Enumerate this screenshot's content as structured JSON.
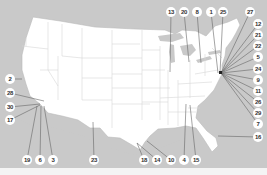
{
  "map": {
    "title": "United States map with numbered callouts",
    "colors": {
      "ocean": "#c9c9c9",
      "land": "#ffffff",
      "border": "#d6d6d6",
      "leader": "#666666",
      "marker": "#222222"
    },
    "labels": [
      {
        "id": "13",
        "x": 171,
        "y": 12,
        "tx": 170,
        "ty": 72
      },
      {
        "id": "20",
        "x": 184,
        "y": 12,
        "tx": 189,
        "ty": 62
      },
      {
        "id": "8",
        "x": 197,
        "y": 12,
        "tx": 201,
        "ty": 63
      },
      {
        "id": "1",
        "x": 211,
        "y": 12,
        "tx": 218,
        "ty": 73
      },
      {
        "id": "25",
        "x": 223,
        "y": 12,
        "tx": 220,
        "ty": 73
      },
      {
        "id": "27",
        "x": 250,
        "y": 12,
        "tx": 221,
        "ty": 73
      },
      {
        "id": "12",
        "x": 258,
        "y": 24,
        "tx": 221,
        "ty": 73
      },
      {
        "id": "21",
        "x": 258,
        "y": 35,
        "tx": 221,
        "ty": 73
      },
      {
        "id": "22",
        "x": 258,
        "y": 46,
        "tx": 221,
        "ty": 73
      },
      {
        "id": "5",
        "x": 258,
        "y": 57,
        "tx": 221,
        "ty": 73
      },
      {
        "id": "24",
        "x": 258,
        "y": 69,
        "tx": 221,
        "ty": 73
      },
      {
        "id": "9",
        "x": 258,
        "y": 80,
        "tx": 221,
        "ty": 73
      },
      {
        "id": "11",
        "x": 258,
        "y": 91,
        "tx": 221,
        "ty": 73
      },
      {
        "id": "26",
        "x": 258,
        "y": 102,
        "tx": 221,
        "ty": 73
      },
      {
        "id": "29",
        "x": 258,
        "y": 113,
        "tx": 221,
        "ty": 73
      },
      {
        "id": "7",
        "x": 258,
        "y": 124,
        "tx": 221,
        "ty": 73
      },
      {
        "id": "16",
        "x": 258,
        "y": 137,
        "tx": 218,
        "ty": 136
      },
      {
        "id": "2",
        "x": 10,
        "y": 79,
        "tx": 22,
        "ty": 79
      },
      {
        "id": "28",
        "x": 10,
        "y": 93,
        "tx": 44,
        "ty": 101
      },
      {
        "id": "30",
        "x": 10,
        "y": 107,
        "tx": 40,
        "ty": 104
      },
      {
        "id": "17",
        "x": 10,
        "y": 120,
        "tx": 40,
        "ty": 105
      },
      {
        "id": "19",
        "x": 27,
        "y": 160,
        "tx": 37,
        "ty": 106
      },
      {
        "id": "6",
        "x": 40,
        "y": 160,
        "tx": 41,
        "ty": 106
      },
      {
        "id": "3",
        "x": 53,
        "y": 160,
        "tx": 44,
        "ty": 106
      },
      {
        "id": "23",
        "x": 94,
        "y": 160,
        "tx": 93,
        "ty": 122
      },
      {
        "id": "18",
        "x": 144,
        "y": 160,
        "tx": 137,
        "ty": 143
      },
      {
        "id": "14",
        "x": 157,
        "y": 160,
        "tx": 137,
        "ty": 143
      },
      {
        "id": "10",
        "x": 171,
        "y": 160,
        "tx": 147,
        "ty": 141
      },
      {
        "id": "4",
        "x": 184,
        "y": 160,
        "tx": 186,
        "ty": 104
      },
      {
        "id": "15",
        "x": 196,
        "y": 160,
        "tx": 190,
        "ty": 105
      }
    ]
  }
}
